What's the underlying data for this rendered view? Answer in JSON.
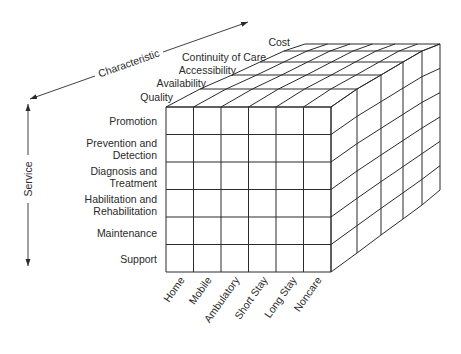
{
  "diagram": {
    "type": "3d-cube-matrix",
    "axes": {
      "characteristic": {
        "label": "Characteristic",
        "items": [
          "Quality",
          "Availability",
          "Accessibility",
          "Continuity of Care",
          "Cost"
        ]
      },
      "service": {
        "label": "Service",
        "items": [
          [
            "Promotion"
          ],
          [
            "Prevention and",
            "Detection"
          ],
          [
            "Diagnosis and",
            "Treatment"
          ],
          [
            "Habilitation and",
            "Rehabilitation"
          ],
          [
            "Maintenance"
          ],
          [
            "Support"
          ]
        ]
      },
      "setting": {
        "items": [
          "Home",
          "Mobile",
          "Ambulatory",
          "Short Stay",
          "Long Stay",
          "Noncare"
        ]
      }
    },
    "colors": {
      "line": "#2b2b2b",
      "text": "#2a2a2a",
      "background": "#ffffff"
    }
  }
}
